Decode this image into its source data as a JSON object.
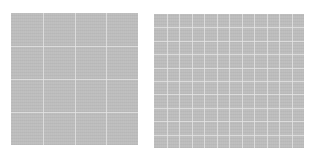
{
  "images": [
    {
      "name": "coarse-grid-texture",
      "color": "#bdbdbd",
      "grid_rows": 4,
      "grid_cols": 4
    },
    {
      "name": "fine-grid-texture",
      "color": "#bdbdbd",
      "grid_rows": 10,
      "grid_cols": 12
    }
  ]
}
